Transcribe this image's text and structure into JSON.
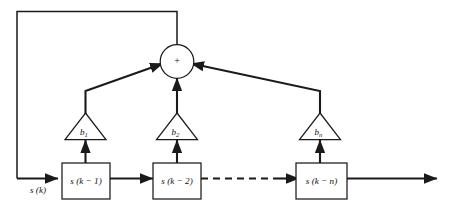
{
  "diagram": {
    "background_color": "#ffffff",
    "line_color": "#1a1a1a",
    "input": {
      "label": "s (k)"
    },
    "summer": {
      "operator": "+",
      "name": "summing-junction"
    },
    "delay_blocks": [
      {
        "label_main": "s (k − 1)",
        "name": "delay-block-1"
      },
      {
        "label_main": "s (k − 2)",
        "name": "delay-block-2"
      },
      {
        "label_main": "s (k − n)",
        "name": "delay-block-n"
      }
    ],
    "gain_blocks": [
      {
        "label_base": "b",
        "label_sub": "1",
        "name": "gain-b1"
      },
      {
        "label_base": "b",
        "label_sub": "2",
        "name": "gain-b2"
      },
      {
        "label_base": "b",
        "label_sub": "n",
        "name": "gain-bn"
      }
    ],
    "connections": {
      "ellipsis_style": "dashed",
      "feedback_path": "summer-output-to-input-line",
      "output_path": "right-output-arrow"
    }
  }
}
